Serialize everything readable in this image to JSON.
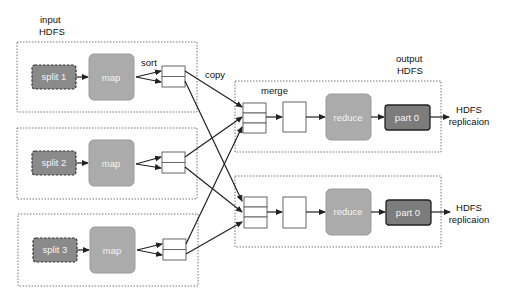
{
  "input_label": {
    "line1": "input",
    "line2": "HDFS"
  },
  "output_label": {
    "line1": "output",
    "line2": "HDFS"
  },
  "annotations": {
    "sort": "sort",
    "copy": "copy",
    "merge": "merge"
  },
  "map_tasks": [
    {
      "split": "split 1",
      "map": "map"
    },
    {
      "split": "split 2",
      "map": "map"
    },
    {
      "split": "split 3",
      "map": "map"
    }
  ],
  "reduce_tasks": [
    {
      "reduce": "reduce",
      "part": "part 0",
      "dest_line1": "HDFS",
      "dest_line2": "replicaion"
    },
    {
      "reduce": "reduce",
      "part": "part 0",
      "dest_line1": "HDFS",
      "dest_line2": "replicaion"
    }
  ],
  "colors": {
    "split_fill": "#8a8a8a",
    "map_fill": "#ababab",
    "reduce_fill": "#ababab",
    "part_fill": "#7c7c7c",
    "edge": "#222222"
  }
}
